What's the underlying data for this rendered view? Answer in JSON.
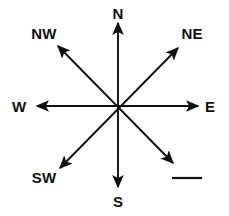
{
  "figure": {
    "kind": "compass-rose",
    "background_color": "#ffffff",
    "stroke_color": "#111111",
    "text_color": "#111111",
    "width": 229,
    "height": 216,
    "center": {
      "x": 118,
      "y": 106
    }
  },
  "labels": {
    "north": "N",
    "northeast": "NE",
    "east": "E",
    "southeast": "",
    "south": "S",
    "southwest": "SW",
    "west": "W",
    "northwest": "NW"
  },
  "label_positions": {
    "north": {
      "x": 118,
      "y": 13
    },
    "northeast": {
      "x": 192,
      "y": 33
    },
    "east": {
      "x": 211,
      "y": 106
    },
    "southeast": {
      "x": 187,
      "y": 178
    },
    "south": {
      "x": 118,
      "y": 201
    },
    "southwest": {
      "x": 44,
      "y": 178
    },
    "west": {
      "x": 20,
      "y": 106
    },
    "northwest": {
      "x": 44,
      "y": 33
    }
  },
  "rays": [
    {
      "name": "north",
      "label": "N",
      "angle_deg": 0,
      "tip": {
        "x": 118,
        "y": 23
      }
    },
    {
      "name": "northeast",
      "label": "NE",
      "angle_deg": 45,
      "tip": {
        "x": 178,
        "y": 48
      }
    },
    {
      "name": "east",
      "label": "E",
      "angle_deg": 90,
      "tip": {
        "x": 198,
        "y": 106
      }
    },
    {
      "name": "southeast",
      "label": "",
      "angle_deg": 135,
      "tip": {
        "x": 173,
        "y": 163
      }
    },
    {
      "name": "south",
      "label": "S",
      "angle_deg": 180,
      "tip": {
        "x": 118,
        "y": 187
      }
    },
    {
      "name": "southwest",
      "label": "SW",
      "angle_deg": 225,
      "tip": {
        "x": 60,
        "y": 168
      }
    },
    {
      "name": "west",
      "label": "W",
      "angle_deg": 270,
      "tip": {
        "x": 37,
        "y": 106
      }
    },
    {
      "name": "northwest",
      "label": "NW",
      "angle_deg": 315,
      "tip": {
        "x": 58,
        "y": 46
      }
    }
  ],
  "blank_line": {
    "present": true,
    "x1": 172,
    "x2": 202,
    "y": 178,
    "thickness": 2
  }
}
